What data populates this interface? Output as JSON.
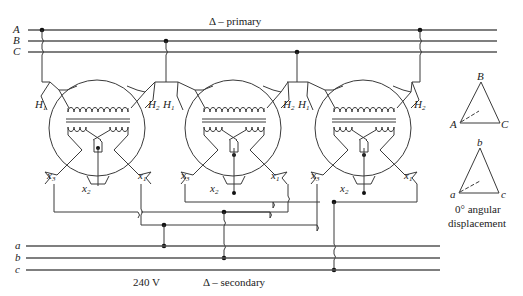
{
  "title_primary": "Δ – primary",
  "title_secondary": "Δ – secondary",
  "voltage_label": "240 V",
  "primary_lines": [
    "A",
    "B",
    "C"
  ],
  "secondary_lines": [
    "a",
    "b",
    "c"
  ],
  "transformers": [
    {
      "id": "T1",
      "h1": "H",
      "h1_sub": "1",
      "h2": "H",
      "h2_sub": "2",
      "x1": "x",
      "x1_sub": "1",
      "x2": "x",
      "x2_sub": "2",
      "x3": "x",
      "x3_sub": "3"
    },
    {
      "id": "T2",
      "h1": "H",
      "h1_sub": "1",
      "h2": "H",
      "h2_sub": "2",
      "x1": "x",
      "x1_sub": "1",
      "x2": "x",
      "x2_sub": "2",
      "x3": "x",
      "x3_sub": "3"
    },
    {
      "id": "T3",
      "h1": "H",
      "h1_sub": "1",
      "h2": "H",
      "h2_sub": "2",
      "x1": "x",
      "x1_sub": "1",
      "x2": "x",
      "x2_sub": "2",
      "x3": "x",
      "x3_sub": "3"
    }
  ],
  "phasor_primary": {
    "top": "B",
    "left": "A",
    "right": "C"
  },
  "phasor_secondary": {
    "top": "b",
    "left": "a",
    "right": "c"
  },
  "displacement_line1": "0° angular",
  "displacement_line2": "displacement"
}
